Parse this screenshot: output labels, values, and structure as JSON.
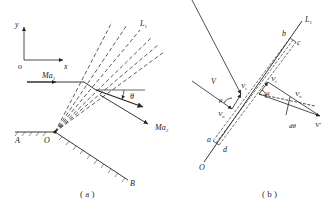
{
  "figure_a": {
    "caption": "( a )",
    "axis_y": "y",
    "axis_x": "x",
    "origin": "o",
    "mach_in": "Ma",
    "mach_in_sub": "1",
    "mach_out": "Ma",
    "mach_out_sub": "2",
    "angle": "θ",
    "fan_line": "L",
    "fan_line_sub": "1",
    "point_A": "A",
    "point_O": "O",
    "point_B": "B"
  },
  "figure_b": {
    "caption": "( b )",
    "line": "L",
    "line_sub": "1",
    "point_b": "b",
    "point_c": "c",
    "point_a": "a",
    "point_d": "d",
    "point_O": "O",
    "vel_V": "V",
    "vel_Vt": "V",
    "vel_Vt_sub": "t",
    "vel_Vn": "V",
    "vel_Vn_sub": "n",
    "mu1": "μ",
    "vel_Vt_prime": "V",
    "vel_Vt_prime_sub": "t",
    "vel_Vn_prime": "V",
    "vel_Vn_prime_sub": "n",
    "mu2": "μ",
    "dtheta": "dθ",
    "vel_V_prime": "V'"
  }
}
